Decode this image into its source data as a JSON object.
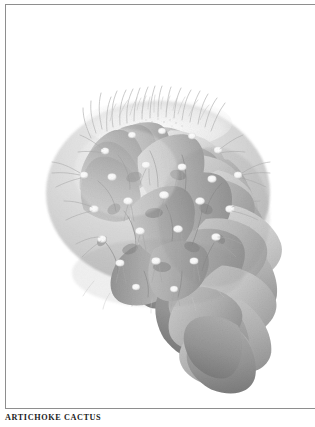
{
  "plate": {
    "caption": "ARTICHOKE CACTUS",
    "subject": "artichoke cactus",
    "medium": "grayscale pencil botanical illustration",
    "background_color": "#ffffff",
    "frame": {
      "rule_color": "#8e8e8e",
      "top_rule": true,
      "bottom_rule": true,
      "left_rule": true,
      "right_rule": false
    },
    "caption_color": "#1b1b1b",
    "illustration": {
      "name": "artichoke-cactus-drawing",
      "light_direction": "upper-left",
      "palette": {
        "highlight": "#f2f2f2",
        "light": "#d2d2d2",
        "mid": "#b4b4b4",
        "mid_dark": "#9a9a9a",
        "shadow": "#7c7c7c",
        "deep_shadow": "#5f5f5f",
        "areole_white": "#fdfdfd",
        "spine": "#b9b9b9"
      },
      "bounds": {
        "x": 40,
        "y": 85,
        "width": 235,
        "height": 212
      },
      "crown_center": {
        "x": 157,
        "y": 150
      },
      "features": [
        "overlapping triangular tubercles",
        "white woolly areoles at tubercle tips",
        "fine hair-like spines radiating from crown",
        "rosette arranged in concentric rings"
      ]
    }
  }
}
